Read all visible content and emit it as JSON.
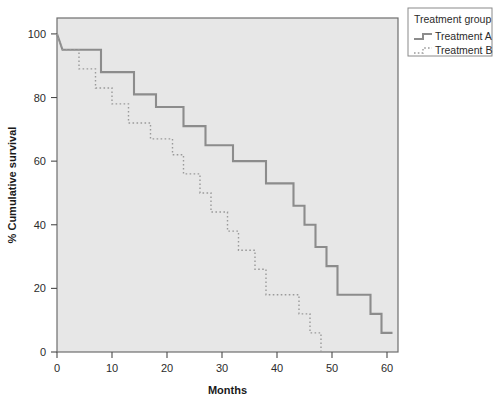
{
  "chart_data": {
    "type": "line",
    "subtype": "kaplan-meier-step",
    "title": "",
    "xlabel": "Months",
    "ylabel": "% Cumulative survival",
    "xlim": [
      0,
      62
    ],
    "ylim": [
      0,
      105
    ],
    "xticks": [
      0,
      10,
      20,
      30,
      40,
      50,
      60
    ],
    "xtick_labels": [
      "0",
      "10",
      "20",
      "30",
      "40",
      "50",
      "60"
    ],
    "yticks": [
      0,
      20,
      40,
      60,
      80,
      100
    ],
    "ytick_labels": [
      "0",
      "20",
      "40",
      "60",
      "80",
      "100"
    ],
    "grid": false,
    "plot_background": "#e7e7e7",
    "figure_background": "#ffffff",
    "legend": {
      "title": "Treatment group",
      "position": "top-right-outside",
      "entries": [
        {
          "name": "Treatment A",
          "style": "solid",
          "color": "#8c8c8c"
        },
        {
          "name": "Treatment B",
          "style": "dotted",
          "color": "#9a9a9a"
        }
      ]
    },
    "series": [
      {
        "name": "Treatment A",
        "style": "solid",
        "color": "#8c8c8c",
        "points": [
          [
            0,
            100
          ],
          [
            1,
            95
          ],
          [
            8,
            95
          ],
          [
            8,
            88
          ],
          [
            14,
            88
          ],
          [
            14,
            81
          ],
          [
            18,
            81
          ],
          [
            18,
            77
          ],
          [
            23,
            77
          ],
          [
            23,
            71
          ],
          [
            27,
            71
          ],
          [
            27,
            65
          ],
          [
            32,
            65
          ],
          [
            32,
            60
          ],
          [
            38,
            60
          ],
          [
            38,
            53
          ],
          [
            43,
            53
          ],
          [
            43,
            46
          ],
          [
            45,
            46
          ],
          [
            45,
            40
          ],
          [
            47,
            40
          ],
          [
            47,
            33
          ],
          [
            49,
            33
          ],
          [
            49,
            27
          ],
          [
            51,
            27
          ],
          [
            51,
            18
          ],
          [
            57,
            18
          ],
          [
            57,
            12
          ],
          [
            59,
            12
          ],
          [
            59,
            6
          ],
          [
            61,
            6
          ]
        ]
      },
      {
        "name": "Treatment B",
        "style": "dotted",
        "color": "#9a9a9a",
        "points": [
          [
            0,
            100
          ],
          [
            1,
            95
          ],
          [
            4,
            95
          ],
          [
            4,
            89
          ],
          [
            7,
            89
          ],
          [
            7,
            83
          ],
          [
            10,
            83
          ],
          [
            10,
            78
          ],
          [
            13,
            78
          ],
          [
            13,
            72
          ],
          [
            17,
            72
          ],
          [
            17,
            67
          ],
          [
            21,
            67
          ],
          [
            21,
            62
          ],
          [
            23,
            62
          ],
          [
            23,
            56
          ],
          [
            26,
            56
          ],
          [
            26,
            50
          ],
          [
            28,
            50
          ],
          [
            28,
            44
          ],
          [
            31,
            44
          ],
          [
            31,
            38
          ],
          [
            33,
            38
          ],
          [
            33,
            32
          ],
          [
            36,
            32
          ],
          [
            36,
            26
          ],
          [
            38,
            26
          ],
          [
            38,
            18
          ],
          [
            44,
            18
          ],
          [
            44,
            12
          ],
          [
            46,
            12
          ],
          [
            46,
            6
          ],
          [
            48,
            6
          ],
          [
            48,
            0
          ]
        ]
      }
    ]
  }
}
